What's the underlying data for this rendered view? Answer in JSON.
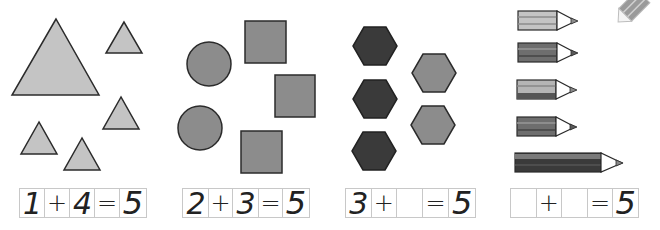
{
  "colors": {
    "light_gray": "#c4c4c4",
    "mid_gray": "#8c8c8c",
    "dark_gray": "#3a3a3a",
    "outline": "#2b2b2b",
    "grid_line": "#c8c8c8"
  },
  "corner_icon": "pencil-icon",
  "panels": [
    {
      "name": "triangles",
      "shapes": {
        "large_triangles": 1,
        "small_triangles": 4
      },
      "equation": {
        "a": "1",
        "op": "+",
        "b": "4",
        "eq": "=",
        "result": "5"
      }
    },
    {
      "name": "circles-squares",
      "shapes": {
        "circles": 2,
        "squares": 3
      },
      "equation": {
        "a": "2",
        "op": "+",
        "b": "3",
        "eq": "=",
        "result": "5"
      }
    },
    {
      "name": "hexagons",
      "shapes": {
        "dark_hexagons": 3,
        "light_hexagons": 2
      },
      "equation": {
        "a": "3",
        "op": "+",
        "b": "",
        "eq": "=",
        "result": "5"
      }
    },
    {
      "name": "pencils",
      "shapes": {
        "short_pencils": 4,
        "long_pencils": 1
      },
      "equation": {
        "a": "",
        "op": "+",
        "b": "",
        "eq": "=",
        "result": "5"
      }
    }
  ]
}
